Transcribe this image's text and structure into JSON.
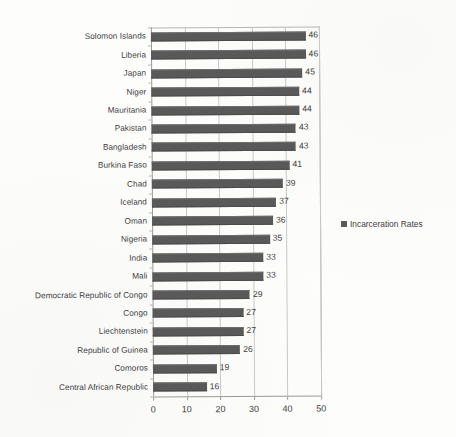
{
  "chart_data": {
    "type": "bar",
    "orientation": "horizontal",
    "title": "",
    "xlabel": "",
    "ylabel": "",
    "xlim": [
      0,
      50
    ],
    "xticks": [
      0,
      10,
      20,
      30,
      40,
      50
    ],
    "grid": true,
    "legend_position": "right",
    "series_name": "Incarceration Rates",
    "bar_color": "#595959",
    "gridline_color": "#c8c8c8",
    "axis_color": "#9a9a9a",
    "text_color": "#3f3f3f",
    "background_color": "#fdfdfc",
    "categories": [
      "Solomon Islands",
      "Liberia",
      "Japan",
      "Niger",
      "Mauritania",
      "Pakistan",
      "Bangladesh",
      "Burkina Faso",
      "Chad",
      "Iceland",
      "Oman",
      "Nigeria",
      "India",
      "Mali",
      "Democratic Republic of Congo",
      "Congo",
      "Liechtenstein",
      "Republic of Guinea",
      "Comoros",
      "Central African Republic"
    ],
    "values": [
      46,
      46,
      45,
      44,
      44,
      43,
      43,
      41,
      39,
      37,
      36,
      35,
      33,
      33,
      29,
      27,
      27,
      26,
      19,
      16
    ],
    "data_labels": [
      "46",
      "46",
      "45",
      "44",
      "44",
      "43",
      "43",
      "41",
      "39",
      "37",
      "36",
      "35",
      "33",
      "33",
      "29",
      "27",
      "27",
      "26",
      "19",
      "16"
    ]
  },
  "legend": {
    "entries": [
      {
        "label": "Incarceration Rates",
        "color": "#595959",
        "marker": "square-marker-icon"
      }
    ]
  },
  "axis": {
    "x_tick_labels": [
      "0",
      "10",
      "20",
      "30",
      "40",
      "50"
    ]
  }
}
